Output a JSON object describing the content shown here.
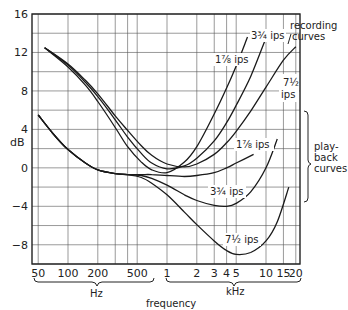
{
  "chart_data": {
    "type": "line",
    "title": "",
    "xlabel": "frequency",
    "ylabel": "dB",
    "xscale": "log",
    "xlim": [
      50,
      20000
    ],
    "ylim": [
      -10,
      16
    ],
    "grid": true,
    "yticks": [
      {
        "value": 16,
        "label": "16"
      },
      {
        "value": 12,
        "label": "12"
      },
      {
        "value": 8,
        "label": "8"
      },
      {
        "value": 4,
        "label": "4"
      },
      {
        "value": 0,
        "label": "0"
      },
      {
        "value": -4,
        "label": "−4"
      },
      {
        "value": -8,
        "label": "−8"
      }
    ],
    "ygrid": [
      16,
      14,
      12,
      10,
      8,
      6,
      4,
      2,
      0,
      -2,
      -4,
      -6,
      -8,
      -10
    ],
    "xticks": [
      {
        "value": 50,
        "label": "50"
      },
      {
        "value": 100,
        "label": "100"
      },
      {
        "value": 200,
        "label": "200"
      },
      {
        "value": 500,
        "label": "500"
      },
      {
        "value": 1000,
        "label": "1"
      },
      {
        "value": 2000,
        "label": "2"
      },
      {
        "value": 3000,
        "label": "3"
      },
      {
        "value": 4000,
        "label": "4"
      },
      {
        "value": 5000,
        "label": "5"
      },
      {
        "value": 10000,
        "label": "10"
      },
      {
        "value": 15000,
        "label": "15"
      },
      {
        "value": 20000,
        "label": "20"
      }
    ],
    "xgrid": [
      50,
      100,
      200,
      300,
      400,
      500,
      1000,
      2000,
      3000,
      4000,
      5000,
      10000,
      15000,
      20000
    ],
    "x_unit_groups": [
      {
        "label": "Hz",
        "from": 50,
        "to": 700
      },
      {
        "label": "kHz",
        "from": 1000,
        "to": 20000
      }
    ],
    "group_annotations": [
      {
        "label_lines": [
          "recording",
          "curves"
        ],
        "position": "top-right"
      },
      {
        "label_lines": [
          "play-",
          "back",
          "curves"
        ],
        "position": "right"
      }
    ],
    "series": [
      {
        "name": "1 7/8 ips recording",
        "group": "recording",
        "label_html": "1⅞ ips",
        "points": [
          [
            58,
            12.5
          ],
          [
            100,
            10.5
          ],
          [
            150,
            8.6
          ],
          [
            200,
            6.9
          ],
          [
            300,
            4.2
          ],
          [
            400,
            2.2
          ],
          [
            550,
            0.6
          ],
          [
            700,
            -0.2
          ],
          [
            1000,
            -0.5
          ],
          [
            1500,
            0.6
          ],
          [
            2000,
            2.2
          ],
          [
            3000,
            5.6
          ],
          [
            4000,
            8.3
          ],
          [
            5000,
            10.6
          ],
          [
            6500,
            13.6
          ]
        ]
      },
      {
        "name": "3 3/4 ips recording",
        "group": "recording",
        "label_html": "3¾ ips",
        "points": [
          [
            58,
            12.5
          ],
          [
            100,
            10.7
          ],
          [
            150,
            8.9
          ],
          [
            200,
            7.4
          ],
          [
            300,
            5.0
          ],
          [
            400,
            3.2
          ],
          [
            550,
            1.5
          ],
          [
            700,
            0.5
          ],
          [
            1000,
            -0.1
          ],
          [
            1500,
            0.2
          ],
          [
            2000,
            1.0
          ],
          [
            3000,
            2.8
          ],
          [
            4000,
            4.7
          ],
          [
            5000,
            6.5
          ],
          [
            7000,
            9.5
          ],
          [
            10000,
            13.5
          ]
        ]
      },
      {
        "name": "7 1/2 ips recording",
        "group": "recording",
        "label_html": "7½ ips",
        "points": [
          [
            58,
            12.5
          ],
          [
            100,
            10.8
          ],
          [
            150,
            9.1
          ],
          [
            200,
            7.7
          ],
          [
            300,
            5.4
          ],
          [
            400,
            3.9
          ],
          [
            550,
            2.3
          ],
          [
            700,
            1.3
          ],
          [
            1000,
            0.4
          ],
          [
            1500,
            0.1
          ],
          [
            2000,
            0.4
          ],
          [
            3000,
            1.4
          ],
          [
            4000,
            2.6
          ],
          [
            5000,
            3.8
          ],
          [
            7000,
            5.9
          ],
          [
            10000,
            8.4
          ],
          [
            15000,
            11.2
          ],
          [
            20000,
            12.6
          ]
        ]
      },
      {
        "name": "1 7/8 ips playback",
        "group": "playback",
        "label_html": "1⅞ ips",
        "points": [
          [
            50,
            5.5
          ],
          [
            70,
            3.6
          ],
          [
            100,
            1.9
          ],
          [
            150,
            0.5
          ],
          [
            200,
            -0.2
          ],
          [
            300,
            -0.6
          ],
          [
            400,
            -0.7
          ],
          [
            550,
            -0.7
          ],
          [
            700,
            -0.7
          ],
          [
            1000,
            -0.8
          ],
          [
            1500,
            -0.9
          ],
          [
            2000,
            -0.8
          ],
          [
            3000,
            -0.5
          ],
          [
            4000,
            0
          ],
          [
            5000,
            0.5
          ],
          [
            7500,
            1.4
          ]
        ]
      },
      {
        "name": "3 3/4 ips playback",
        "group": "playback",
        "label_html": "3¾ ips",
        "points": [
          [
            50,
            5.5
          ],
          [
            70,
            3.6
          ],
          [
            100,
            1.9
          ],
          [
            150,
            0.5
          ],
          [
            200,
            -0.2
          ],
          [
            300,
            -0.6
          ],
          [
            400,
            -0.7
          ],
          [
            550,
            -0.8
          ],
          [
            700,
            -1.1
          ],
          [
            1000,
            -1.8
          ],
          [
            1500,
            -2.8
          ],
          [
            2000,
            -3.4
          ],
          [
            3000,
            -3.9
          ],
          [
            4000,
            -4.0
          ],
          [
            5000,
            -3.7
          ],
          [
            7000,
            -2.5
          ],
          [
            10000,
            0
          ],
          [
            13000,
            3.0
          ]
        ]
      },
      {
        "name": "7 1/2 ips playback",
        "group": "playback",
        "label_html": "7½ ips",
        "points": [
          [
            50,
            5.5
          ],
          [
            70,
            3.6
          ],
          [
            100,
            1.9
          ],
          [
            150,
            0.5
          ],
          [
            200,
            -0.2
          ],
          [
            300,
            -0.6
          ],
          [
            400,
            -0.7
          ],
          [
            550,
            -1.0
          ],
          [
            700,
            -1.6
          ],
          [
            1000,
            -2.8
          ],
          [
            1500,
            -4.6
          ],
          [
            2000,
            -5.9
          ],
          [
            3000,
            -7.6
          ],
          [
            4000,
            -8.6
          ],
          [
            5000,
            -9.0
          ],
          [
            7000,
            -8.8
          ],
          [
            10000,
            -7.6
          ],
          [
            13000,
            -5.6
          ],
          [
            17000,
            -2.0
          ]
        ]
      }
    ]
  }
}
